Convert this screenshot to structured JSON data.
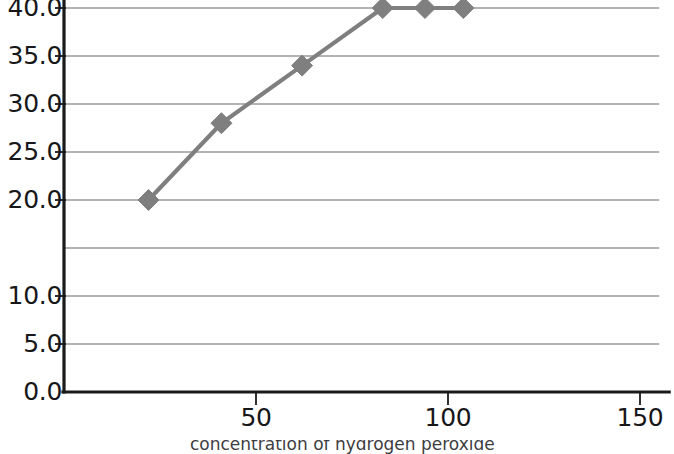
{
  "chart_data": {
    "type": "line",
    "title": "",
    "subtitle": "",
    "xlabel": "concentration of hydrogen peroxide",
    "ylabel": "",
    "xlim": [
      0,
      155
    ],
    "ylim": [
      0,
      45
    ],
    "grid": true,
    "legend": false,
    "legend_position": "none",
    "marker": "diamond",
    "series": [
      {
        "name": "rate",
        "color": "#7f7f7f",
        "x": [
          22,
          41,
          62,
          83,
          94,
          104
        ],
        "y": [
          20.0,
          28.0,
          34.0,
          40.0,
          40.0,
          40.0
        ],
        "points": [
          {
            "x": 22,
            "y": 20.0
          },
          {
            "x": 41,
            "y": 28.0
          },
          {
            "x": 62,
            "y": 34.0
          },
          {
            "x": 83,
            "y": 40.0
          },
          {
            "x": 94,
            "y": 40.0
          },
          {
            "x": 104,
            "y": 40.0
          }
        ]
      }
    ],
    "y_tick_values": [
      0.0,
      5.0,
      10.0,
      20.0,
      25.0,
      30.0,
      35.0,
      40.0,
      45.0
    ],
    "y_tick_labels": [
      "0.0",
      "5.0",
      "10.0",
      "20.0",
      "25.0",
      "30.0",
      "35.0",
      "40.0",
      "45.0"
    ],
    "y_gridline_values": [
      5.0,
      10.0,
      15.0,
      20.0,
      25.0,
      30.0,
      35.0,
      40.0,
      45.0
    ],
    "x_tick_values": [
      50,
      100,
      150
    ],
    "x_tick_labels": [
      "50",
      "100",
      "150"
    ],
    "annotations": []
  },
  "axis": {
    "x_title_clipped": "concentration of hydrogen peroxide"
  },
  "colors": {
    "series": "#7f7f7f",
    "gridline": "#9a9a9a",
    "axis": "#1a1a1a",
    "text": "#17171a",
    "background": "#ffffff"
  }
}
